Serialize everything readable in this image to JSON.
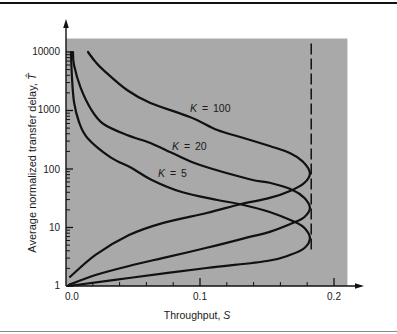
{
  "chart_data": {
    "type": "line",
    "title": "",
    "xlabel": "Throughput, S",
    "ylabel": "Average normalized transfer delay, T̂",
    "xlabel_parts": {
      "text": "Throughput, ",
      "var": "S"
    },
    "ylabel_parts": {
      "text": "Average normalized transfer delay, ",
      "var": "T̂"
    },
    "xscale": "linear",
    "yscale": "log",
    "xlim": [
      0,
      0.21
    ],
    "ylim": [
      1,
      17000
    ],
    "xticks": [
      0.0,
      0.1,
      0.2
    ],
    "xtick_labels": [
      "0.0",
      "0.1",
      "0.2"
    ],
    "xminor_step": 0.02,
    "yticks": [
      1,
      10,
      100,
      1000,
      10000
    ],
    "ytick_labels": [
      "1",
      "10",
      "100",
      "1000",
      "10000"
    ],
    "grid": false,
    "legend": null,
    "plot_background": "#a9a9a9",
    "line_color": "#111111",
    "reference_line": {
      "orientation": "vertical",
      "x": 0.183,
      "y_range": [
        3.7,
        14000
      ],
      "style": "dashed"
    },
    "series": [
      {
        "name": "K = 5",
        "label_var": "K",
        "label_rest": " = 5",
        "points": [
          [
            0.002,
            1.0
          ],
          [
            0.047,
            1.37
          ],
          [
            0.105,
            2.03
          ],
          [
            0.15,
            2.67
          ],
          [
            0.167,
            3.39
          ],
          [
            0.178,
            4.47
          ],
          [
            0.182,
            6.6
          ],
          [
            0.178,
            9.8
          ],
          [
            0.171,
            12.4
          ],
          [
            0.152,
            18.4
          ],
          [
            0.13,
            25
          ],
          [
            0.113,
            29.5
          ],
          [
            0.087,
            40
          ],
          [
            0.064,
            65
          ],
          [
            0.049,
            104
          ],
          [
            0.033,
            160
          ],
          [
            0.016,
            340
          ],
          [
            0.0097,
            637
          ],
          [
            0.006,
            1400
          ],
          [
            0.0045,
            3600
          ],
          [
            0.0037,
            10000
          ]
        ]
      },
      {
        "name": "K = 20",
        "label_var": "K",
        "label_rest": " = 20",
        "points": [
          [
            0.002,
            1.04
          ],
          [
            0.022,
            1.54
          ],
          [
            0.047,
            2.2
          ],
          [
            0.072,
            3.0
          ],
          [
            0.105,
            4.5
          ],
          [
            0.137,
            6.9
          ],
          [
            0.152,
            8.4
          ],
          [
            0.171,
            12.4
          ],
          [
            0.178,
            15.1
          ],
          [
            0.182,
            21.5
          ],
          [
            0.178,
            32
          ],
          [
            0.169,
            44
          ],
          [
            0.152,
            58
          ],
          [
            0.137,
            67
          ],
          [
            0.1,
            117
          ],
          [
            0.081,
            180
          ],
          [
            0.063,
            278
          ],
          [
            0.0455,
            380
          ],
          [
            0.028,
            588
          ],
          [
            0.019,
            1020
          ],
          [
            0.011,
            2430
          ],
          [
            0.006,
            6000
          ],
          [
            0.0052,
            10000
          ]
        ]
      },
      {
        "name": "K = 100",
        "label_var": "K",
        "label_rest": " = 100",
        "points": [
          [
            0.003,
            1.43
          ],
          [
            0.022,
            3.4
          ],
          [
            0.047,
            7.4
          ],
          [
            0.072,
            11.9
          ],
          [
            0.105,
            17.7
          ],
          [
            0.13,
            25
          ],
          [
            0.152,
            32
          ],
          [
            0.169,
            44
          ],
          [
            0.178,
            58
          ],
          [
            0.182,
            85
          ],
          [
            0.177,
            132
          ],
          [
            0.167,
            188
          ],
          [
            0.152,
            247
          ],
          [
            0.13,
            352
          ],
          [
            0.113,
            463
          ],
          [
            0.0925,
            774
          ],
          [
            0.063,
            1343
          ],
          [
            0.0455,
            2240
          ],
          [
            0.028,
            4900
          ],
          [
            0.022,
            6760
          ],
          [
            0.0164,
            10000
          ]
        ]
      }
    ]
  }
}
